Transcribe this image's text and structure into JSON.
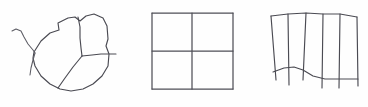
{
  "page": {
    "background_color": "#fefefe",
    "width": 368,
    "height": 107,
    "ink_color": "#4a4a52",
    "figure_count": 3
  },
  "figures": [
    {
      "id": "figure-1",
      "name": "irregular-blob-with-internal-partitions",
      "label": "Irregular closed blob subdivided by internal lines, with a branching tail at left and a short tail at right",
      "stroke_color": "#4a4a52",
      "stroke_width": 1.15,
      "bbox": [
        10,
        14,
        118,
        96
      ],
      "parts": [
        {
          "name": "outer-blob-outline",
          "type": "closed-polyline",
          "points": "34,52 41,41 50,33 59,30 58,23 68,18 75,17 80,21 86,16 94,14 103,18 107,26 108,39 106,46 109,54 108,66 102,76 93,84 83,89 71,91 60,89 50,84 41,76 35,66 33,58 34,52"
        },
        {
          "name": "left-branch-tail-upper",
          "type": "polyline",
          "points": "12,31 16,29 21,31 24,37 28,44 33,50 35,53"
        },
        {
          "name": "left-branch-tail-lower",
          "type": "polyline",
          "points": "35,53 33,60 31,68 30,75"
        },
        {
          "name": "internal-divider-vertical",
          "type": "polyline",
          "points": "78,17 80,27 80,38 81,48 82,56"
        },
        {
          "name": "internal-divider-diagonal",
          "type": "polyline",
          "points": "82,56 73,67 65,78 58,88"
        },
        {
          "name": "internal-horizontal-with-right-tail",
          "type": "polyline",
          "points": "82,56 92,55 101,54 109,54 116,54"
        }
      ]
    },
    {
      "id": "figure-2",
      "name": "square-divided-into-four-quadrants",
      "label": "Square subdivided into four equal quadrants by one vertical and one horizontal line",
      "stroke_color": "#4f4f57",
      "stroke_width": 1.25,
      "bbox": [
        152,
        13,
        233,
        89
      ],
      "parts": [
        {
          "name": "square-outline-top",
          "type": "line",
          "points": "152,13 233,13"
        },
        {
          "name": "square-outline-right",
          "type": "line",
          "points": "233,13 233,89"
        },
        {
          "name": "square-outline-bottom",
          "type": "line",
          "points": "233,89 152,89"
        },
        {
          "name": "square-outline-left",
          "type": "line",
          "points": "152,89 152,13"
        },
        {
          "name": "divider-vertical",
          "type": "line",
          "points": "192,13 192,89"
        },
        {
          "name": "divider-horizontal",
          "type": "line",
          "points": "152,51 233,51"
        }
      ],
      "cells": 4
    },
    {
      "id": "figure-3",
      "name": "curved-fence-with-six-bars",
      "label": "Fence-like figure: a slanted top rail, a wavy lower rail, and six vertical bars extending past the lower rail",
      "stroke_color": "#4a4a52",
      "stroke_width": 1.15,
      "bbox": [
        270,
        12,
        360,
        92
      ],
      "bar_count": 6,
      "parts": [
        {
          "name": "top-rail",
          "type": "polyline",
          "points": "271,16 288,14 306,13 323,14 340,14 357,17"
        },
        {
          "name": "lower-rail-wavy",
          "type": "polyline",
          "points": "273,72 284,68 294,67 303,70 313,76 325,79 337,79 349,79 358,79"
        },
        {
          "name": "bar-1",
          "type": "line",
          "points": "271,16 276,80"
        },
        {
          "name": "bar-2",
          "type": "line",
          "points": "288,14 289,85"
        },
        {
          "name": "bar-3",
          "type": "line",
          "points": "306,13 303,80"
        },
        {
          "name": "bar-4",
          "type": "line",
          "points": "323,14 322,88"
        },
        {
          "name": "bar-5",
          "type": "line",
          "points": "340,14 339,88"
        },
        {
          "name": "bar-6",
          "type": "line",
          "points": "357,17 358,86"
        }
      ]
    }
  ]
}
